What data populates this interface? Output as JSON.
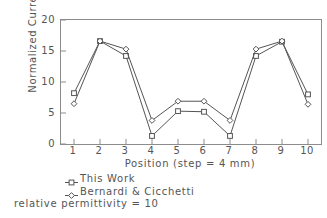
{
  "chart_data": {
    "type": "line",
    "title": "",
    "xlabel": "Position (step = 4 mm)",
    "ylabel": "Normalized Current",
    "x": [
      1,
      2,
      3,
      4,
      5,
      6,
      7,
      8,
      9,
      10
    ],
    "xticklabels": [
      "1",
      "2",
      "3",
      "4",
      "5",
      "6",
      "7",
      "8",
      "9",
      "10"
    ],
    "yticklabels": [
      "0",
      "5",
      "10",
      "15",
      "20"
    ],
    "yticks": [
      0,
      5,
      10,
      15,
      20
    ],
    "xlim": [
      0.5,
      10.5
    ],
    "ylim": [
      0,
      20
    ],
    "grid": false,
    "legend_position": "below-axes",
    "series": [
      {
        "name": "This Work",
        "marker": "square",
        "color": "#555555",
        "values": [
          8.2,
          16.6,
          14.2,
          1.3,
          5.3,
          5.2,
          1.3,
          14.2,
          16.5,
          8.0
        ]
      },
      {
        "name": "Bernardi & Cicchetti",
        "marker": "diamond",
        "color": "#555555",
        "values": [
          6.5,
          16.6,
          15.3,
          3.8,
          6.9,
          6.9,
          3.8,
          15.3,
          16.6,
          6.4
        ]
      }
    ],
    "annotations": [
      "relative permittivity = 10"
    ]
  },
  "legend": {
    "items": [
      {
        "label": "This Work"
      },
      {
        "label": "Bernardi & Cicchetti"
      }
    ]
  },
  "caption": {
    "text": "relative permittivity = 10"
  }
}
